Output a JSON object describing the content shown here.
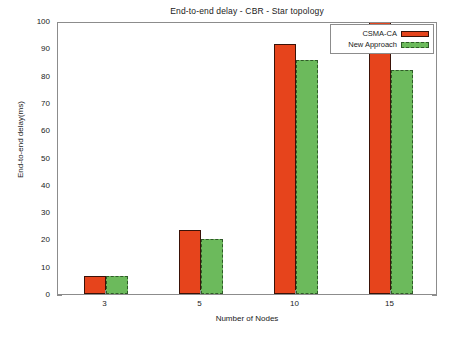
{
  "chart_data": {
    "type": "bar",
    "title": "End-to-end delay - CBR - Star topology",
    "xlabel": "Number of Nodes",
    "ylabel": "End-to-end delay(ms)",
    "categories": [
      "3",
      "5",
      "10",
      "15"
    ],
    "ylim": [
      0,
      100
    ],
    "yticks": [
      "0",
      "10",
      "20",
      "30",
      "40",
      "50",
      "60",
      "70",
      "80",
      "90",
      "100"
    ],
    "grid": false,
    "legend_position": "top-right",
    "series": [
      {
        "name": "CSMA-CA",
        "color": "#e6441c",
        "values": [
          6.5,
          23.5,
          91.5,
          100
        ]
      },
      {
        "name": "New Approach",
        "color": "#6cba5c",
        "values": [
          6.5,
          20.3,
          85.8,
          82
        ]
      }
    ]
  },
  "legend": {
    "items": [
      {
        "label": "CSMA-CA"
      },
      {
        "label": "New Approach"
      }
    ]
  }
}
